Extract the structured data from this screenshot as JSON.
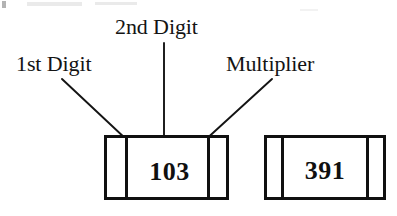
{
  "figure": {
    "background_color": "#ffffff",
    "ink_color": "#101010"
  },
  "callouts": [
    {
      "id": "first-digit",
      "label": "1st Digit",
      "arrow": {
        "from_x": 62,
        "from_y": 80,
        "to_x": 148,
        "to_y": 161,
        "style": "straight-with-solid-head"
      }
    },
    {
      "id": "second-digit",
      "label": "2nd Digit",
      "arrow": {
        "from_x": 164,
        "from_y": 43,
        "to_x": 164,
        "to_y": 155,
        "style": "straight-with-solid-head"
      }
    },
    {
      "id": "multiplier",
      "label": "Multiplier",
      "arrow": {
        "from_x": 272,
        "from_y": 80,
        "to_x": 185,
        "to_y": 159,
        "style": "straight-with-solid-head"
      }
    }
  ],
  "resistors": [
    {
      "id": "resistor-left",
      "code": "103",
      "digits": {
        "first": "1",
        "second": "0",
        "multiplier": "3"
      },
      "terminals": 2
    },
    {
      "id": "resistor-right",
      "code": "391",
      "digits": {
        "first": "3",
        "second": "9",
        "multiplier": "1"
      },
      "terminals": 2
    }
  ],
  "artifacts": {
    "description": "faint residual scan marks along the top edge"
  }
}
